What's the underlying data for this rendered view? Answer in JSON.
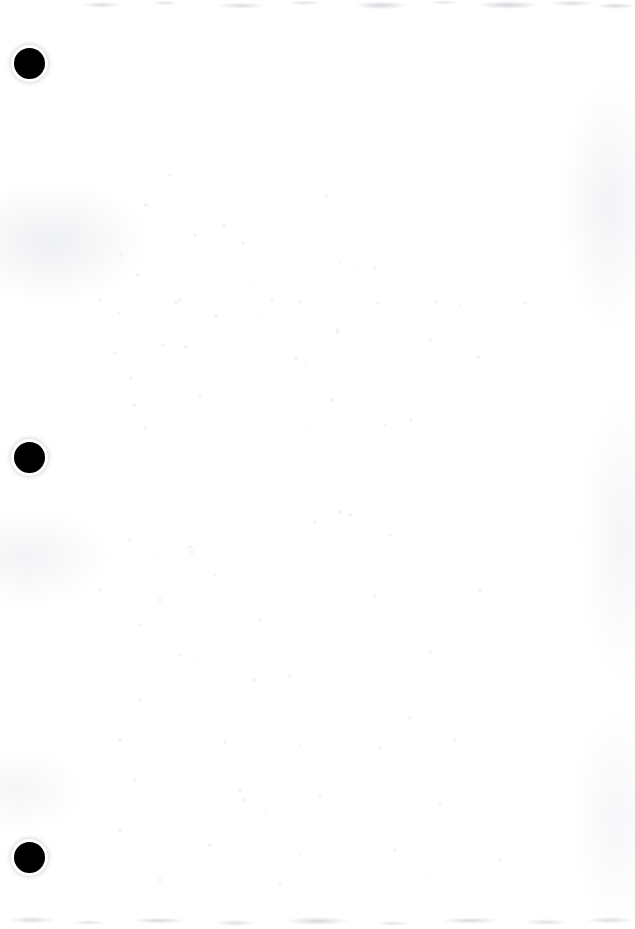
{
  "document": {
    "kind": "scanned-page",
    "page_label": "",
    "body_text": "",
    "width_px": 635,
    "height_px": 929,
    "background_color": "#ffffff",
    "ink_color": "#000000",
    "noise_color": "#cdd0d5"
  },
  "punch_holes": {
    "count": 3,
    "color": "#000000",
    "diameter_px": 31,
    "items": [
      {
        "label": "top-punch-hole",
        "x": 14,
        "y": 48,
        "size": 31
      },
      {
        "label": "middle-punch-hole",
        "x": 14,
        "y": 442,
        "size": 31
      },
      {
        "label": "bottom-punch-hole",
        "x": 14,
        "y": 842,
        "size": 31
      }
    ]
  },
  "scan_artifacts": {
    "top_edge_band": {
      "present": true,
      "y": 0,
      "height": 14,
      "color": "#c8ccd2"
    },
    "bottom_edge_band": {
      "present": true,
      "y": 909,
      "height": 20,
      "color": "#c8ccd2"
    },
    "left_edge_mottle": {
      "present": true,
      "color": "#e2e4e8"
    },
    "right_edge_mottle": {
      "present": true,
      "color": "#e6e8ec"
    },
    "dust_specks": [
      {
        "x": 170,
        "y": 175,
        "r": 2
      },
      {
        "x": 146,
        "y": 205,
        "r": 2
      },
      {
        "x": 224,
        "y": 226,
        "r": 2
      },
      {
        "x": 195,
        "y": 235,
        "r": 2
      },
      {
        "x": 200,
        "y": 245,
        "r": 1
      },
      {
        "x": 326,
        "y": 196,
        "r": 2
      },
      {
        "x": 243,
        "y": 243,
        "r": 2
      },
      {
        "x": 145,
        "y": 200,
        "r": 1
      },
      {
        "x": 121,
        "y": 255,
        "r": 2
      },
      {
        "x": 340,
        "y": 263,
        "r": 1
      },
      {
        "x": 375,
        "y": 268,
        "r": 2
      },
      {
        "x": 138,
        "y": 275,
        "r": 2
      },
      {
        "x": 250,
        "y": 282,
        "r": 1
      },
      {
        "x": 100,
        "y": 300,
        "r": 2
      },
      {
        "x": 355,
        "y": 268,
        "r": 1
      },
      {
        "x": 180,
        "y": 300,
        "r": 2
      },
      {
        "x": 176,
        "y": 303,
        "r": 2
      },
      {
        "x": 272,
        "y": 301,
        "r": 2
      },
      {
        "x": 300,
        "y": 302,
        "r": 2
      },
      {
        "x": 378,
        "y": 303,
        "r": 2
      },
      {
        "x": 436,
        "y": 302,
        "r": 2
      },
      {
        "x": 460,
        "y": 305,
        "r": 1
      },
      {
        "x": 525,
        "y": 303,
        "r": 2
      },
      {
        "x": 119,
        "y": 313,
        "r": 2
      },
      {
        "x": 216,
        "y": 316,
        "r": 2
      },
      {
        "x": 258,
        "y": 315,
        "r": 1
      },
      {
        "x": 338,
        "y": 330,
        "r": 2
      },
      {
        "x": 337,
        "y": 332,
        "r": 2
      },
      {
        "x": 163,
        "y": 345,
        "r": 2
      },
      {
        "x": 186,
        "y": 347,
        "r": 2
      },
      {
        "x": 115,
        "y": 353,
        "r": 2
      },
      {
        "x": 296,
        "y": 358,
        "r": 2
      },
      {
        "x": 305,
        "y": 363,
        "r": 1
      },
      {
        "x": 131,
        "y": 378,
        "r": 2
      },
      {
        "x": 430,
        "y": 340,
        "r": 2
      },
      {
        "x": 445,
        "y": 344,
        "r": 1
      },
      {
        "x": 478,
        "y": 357,
        "r": 2
      },
      {
        "x": 200,
        "y": 397,
        "r": 2
      },
      {
        "x": 134,
        "y": 405,
        "r": 2
      },
      {
        "x": 240,
        "y": 405,
        "r": 1
      },
      {
        "x": 332,
        "y": 400,
        "r": 2
      },
      {
        "x": 411,
        "y": 420,
        "r": 2
      },
      {
        "x": 385,
        "y": 425,
        "r": 2
      },
      {
        "x": 310,
        "y": 430,
        "r": 1
      },
      {
        "x": 145,
        "y": 428,
        "r": 2
      },
      {
        "x": 340,
        "y": 512,
        "r": 2
      },
      {
        "x": 350,
        "y": 515,
        "r": 2
      },
      {
        "x": 270,
        "y": 520,
        "r": 1
      },
      {
        "x": 315,
        "y": 522,
        "r": 2
      },
      {
        "x": 130,
        "y": 540,
        "r": 2
      },
      {
        "x": 190,
        "y": 547,
        "r": 2
      },
      {
        "x": 192,
        "y": 552,
        "r": 2
      },
      {
        "x": 155,
        "y": 555,
        "r": 1
      },
      {
        "x": 215,
        "y": 575,
        "r": 2
      },
      {
        "x": 390,
        "y": 535,
        "r": 2
      },
      {
        "x": 100,
        "y": 590,
        "r": 2
      },
      {
        "x": 160,
        "y": 600,
        "r": 2
      },
      {
        "x": 320,
        "y": 598,
        "r": 1
      },
      {
        "x": 375,
        "y": 596,
        "r": 2
      },
      {
        "x": 480,
        "y": 590,
        "r": 2
      },
      {
        "x": 140,
        "y": 625,
        "r": 2
      },
      {
        "x": 260,
        "y": 620,
        "r": 2
      },
      {
        "x": 180,
        "y": 655,
        "r": 2
      },
      {
        "x": 195,
        "y": 662,
        "r": 1
      },
      {
        "x": 430,
        "y": 652,
        "r": 2
      },
      {
        "x": 255,
        "y": 680,
        "r": 2
      },
      {
        "x": 290,
        "y": 676,
        "r": 2
      },
      {
        "x": 140,
        "y": 700,
        "r": 2
      },
      {
        "x": 320,
        "y": 710,
        "r": 1
      },
      {
        "x": 410,
        "y": 718,
        "r": 2
      },
      {
        "x": 120,
        "y": 740,
        "r": 2
      },
      {
        "x": 225,
        "y": 742,
        "r": 2
      },
      {
        "x": 300,
        "y": 745,
        "r": 1
      },
      {
        "x": 380,
        "y": 748,
        "r": 2
      },
      {
        "x": 455,
        "y": 740,
        "r": 2
      },
      {
        "x": 135,
        "y": 780,
        "r": 2
      },
      {
        "x": 240,
        "y": 790,
        "r": 2
      },
      {
        "x": 245,
        "y": 800,
        "r": 2
      },
      {
        "x": 265,
        "y": 810,
        "r": 1
      },
      {
        "x": 320,
        "y": 795,
        "r": 2
      },
      {
        "x": 440,
        "y": 805,
        "r": 2
      },
      {
        "x": 120,
        "y": 830,
        "r": 2
      },
      {
        "x": 210,
        "y": 845,
        "r": 2
      },
      {
        "x": 300,
        "y": 855,
        "r": 1
      },
      {
        "x": 395,
        "y": 850,
        "r": 2
      },
      {
        "x": 500,
        "y": 860,
        "r": 2
      },
      {
        "x": 160,
        "y": 880,
        "r": 2
      },
      {
        "x": 280,
        "y": 885,
        "r": 2
      },
      {
        "x": 430,
        "y": 875,
        "r": 1
      }
    ]
  }
}
